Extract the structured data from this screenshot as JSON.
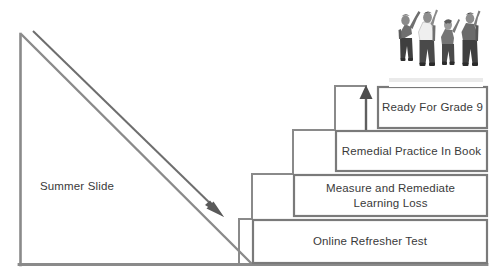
{
  "diagram": {
    "type": "staircase-process-diagram",
    "canvas": {
      "width": 501,
      "height": 279
    },
    "colors": {
      "line": "#808080",
      "box_border": "#7a7a7a",
      "text": "#3a3a3a",
      "background": "#ffffff",
      "arrow": "#4d4d4d"
    },
    "slide_label": "Summer Slide",
    "steps": [
      {
        "id": "step-1",
        "order": 1,
        "label": "Online Refresher Test",
        "box": {
          "x": 253,
          "y": 220,
          "width": 234,
          "height": 43
        }
      },
      {
        "id": "step-2",
        "order": 2,
        "label": "Measure and Remediate\nLearning Loss",
        "box": {
          "x": 294,
          "y": 175,
          "width": 193,
          "height": 41
        }
      },
      {
        "id": "step-3",
        "order": 3,
        "label": "Remedial Practice In Book",
        "box": {
          "x": 336,
          "y": 131,
          "width": 151,
          "height": 40
        }
      },
      {
        "id": "step-4",
        "order": 4,
        "label": "Ready For Grade 9",
        "box": {
          "x": 378,
          "y": 87,
          "width": 109,
          "height": 41
        }
      }
    ],
    "arrows": [
      {
        "id": "summer-slide-arrow",
        "name": "downward-decline-arrow",
        "direction": "down-right",
        "from": {
          "x": 32,
          "y": 31
        },
        "to": {
          "x": 223,
          "y": 215
        }
      },
      {
        "id": "progress-arrow",
        "name": "upward-progress-arrow",
        "direction": "up",
        "from": {
          "x": 245,
          "y": 230
        },
        "to": {
          "x": 367,
          "y": 88
        }
      }
    ],
    "photo": {
      "name": "celebrating-students-photo",
      "description": "Four students with backpacks raising arms in celebration",
      "people_count": 4
    }
  }
}
